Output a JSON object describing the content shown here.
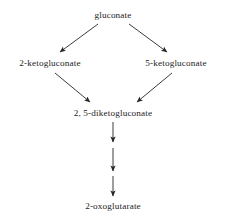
{
  "diagram": {
    "background_color": "#ffffff",
    "text_color": "#1c1c1c",
    "edge_color": "#262626",
    "nodes": [
      {
        "id": "gluconate",
        "label": "gluconate",
        "x": 113,
        "y": 15
      },
      {
        "id": "2-ketogluconate",
        "label": "2-ketogluconate",
        "x": 50,
        "y": 63
      },
      {
        "id": "5-ketogluconate",
        "label": "5-ketogluconate",
        "x": 176,
        "y": 63
      },
      {
        "id": "diketogluconate",
        "label": "2, 5-diketogluconate",
        "x": 113,
        "y": 113
      },
      {
        "id": "oxoglutarate",
        "label": "2-oxoglutarate",
        "x": 113,
        "y": 206
      }
    ],
    "edges": [
      {
        "from": "gluconate",
        "to": "2-ketogluconate",
        "style": "solid",
        "direction": "down-left"
      },
      {
        "from": "gluconate",
        "to": "5-ketogluconate",
        "style": "solid",
        "direction": "down-right"
      },
      {
        "from": "2-ketogluconate",
        "to": "diketogluconate",
        "style": "solid",
        "direction": "down-right"
      },
      {
        "from": "5-ketogluconate",
        "to": "diketogluconate",
        "style": "solid",
        "direction": "down-left"
      },
      {
        "from": "diketogluconate",
        "to": "oxoglutarate",
        "style": "solid",
        "direction": "down",
        "segment": 1
      },
      {
        "from": "diketogluconate",
        "to": "oxoglutarate",
        "style": "solid",
        "direction": "down",
        "segment": 2
      },
      {
        "from": "diketogluconate",
        "to": "oxoglutarate",
        "style": "solid",
        "direction": "down",
        "segment": 3
      }
    ]
  }
}
